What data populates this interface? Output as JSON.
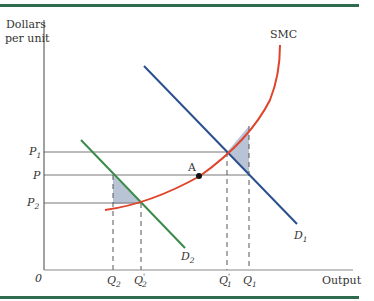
{
  "diagram": {
    "y_axis_label_line1": "Dollars",
    "y_axis_label_line2": "per unit",
    "x_axis_label": "Output",
    "origin_label": "0",
    "curves": {
      "smc": {
        "label": "SMC",
        "color": "#e0432c"
      },
      "d1": {
        "label": "D",
        "sub": "1",
        "color": "#2a4f8f"
      },
      "d2": {
        "label": "D",
        "sub": "2",
        "color": "#3a8a4a"
      }
    },
    "price_labels": {
      "p1": {
        "label": "P",
        "sub": "1"
      },
      "p": {
        "label": "P"
      },
      "p2": {
        "label": "P",
        "sub": "2"
      }
    },
    "quantity_labels": {
      "q2": {
        "label": "Q",
        "sub": "2"
      },
      "q2p": {
        "label": "Q",
        "sub": "2",
        "prime": "'"
      },
      "q1p": {
        "label": "Q",
        "sub": "1",
        "prime": "'"
      },
      "q1": {
        "label": "Q",
        "sub": "1"
      }
    },
    "point_a": {
      "label": "A"
    },
    "frame_color": "#2e6b4f",
    "shade_color": "#b9c3d6"
  }
}
